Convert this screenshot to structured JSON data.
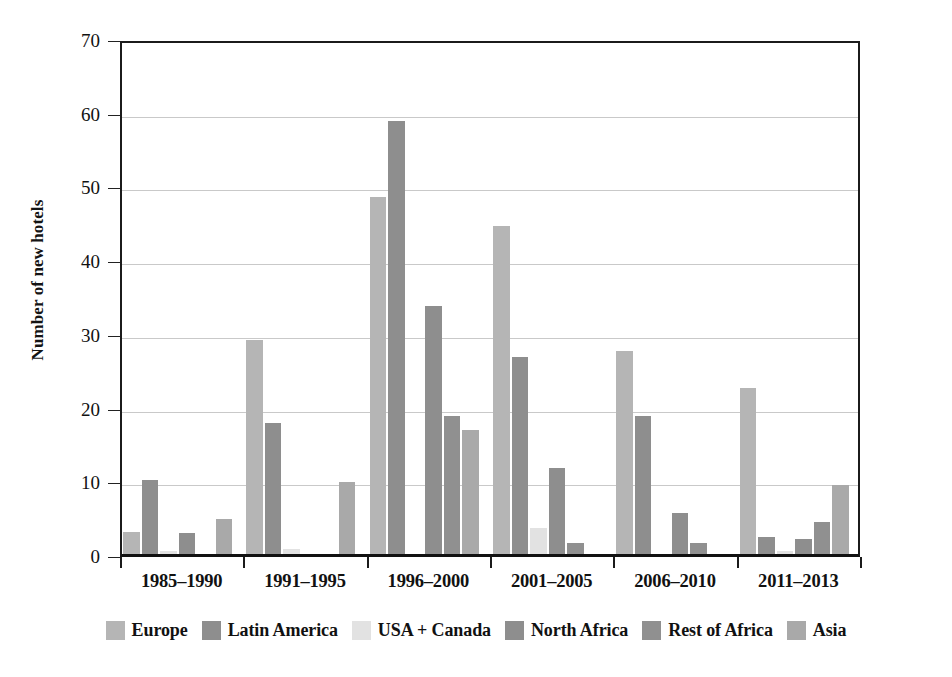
{
  "chart_data": {
    "type": "bar",
    "title": "",
    "subtitle": "",
    "xlabel": "",
    "ylabel": "Number of new hotels",
    "ylim": [
      0,
      70
    ],
    "ytick_labels": [
      "0",
      "10",
      "20",
      "30",
      "40",
      "50",
      "60",
      "70"
    ],
    "ytick_values": [
      0,
      10,
      20,
      30,
      40,
      50,
      60,
      70
    ],
    "grid": true,
    "grid_axis": "y",
    "legend_position": "bottom",
    "categories": [
      "1985–1990",
      "1991–1995",
      "1996–2000",
      "2001–2005",
      "2006–2010",
      "2011–2013"
    ],
    "series": [
      {
        "name": "Europe",
        "color": "#b5b5b5",
        "values": [
          3.0,
          29.0,
          48.5,
          44.5,
          27.5,
          22.5
        ]
      },
      {
        "name": "Latin America",
        "color": "#8e8e8e",
        "values": [
          10.0,
          17.8,
          58.8,
          26.7,
          18.7,
          2.3
        ]
      },
      {
        "name": "USA + Canada",
        "color": "#e2e2e2",
        "values": [
          0.4,
          0.7,
          0.0,
          3.5,
          0.0,
          0.4
        ]
      },
      {
        "name": "North Africa",
        "color": "#8e8e8e",
        "values": [
          2.9,
          0.0,
          33.6,
          11.7,
          5.5,
          2.0
        ]
      },
      {
        "name": "Rest of Africa",
        "color": "#909090",
        "values": [
          0.0,
          0.0,
          18.7,
          1.5,
          1.5,
          4.3
        ]
      },
      {
        "name": "Asia",
        "color": "#a9a9a9",
        "values": [
          4.8,
          9.8,
          16.8,
          0.0,
          0.0,
          9.3
        ]
      }
    ]
  },
  "legend": {
    "items": [
      {
        "label": "Europe",
        "color": "#b5b5b5"
      },
      {
        "label": "Latin America",
        "color": "#8e8e8e"
      },
      {
        "label": "USA + Canada",
        "color": "#e2e2e2"
      },
      {
        "label": "North Africa",
        "color": "#8e8e8e"
      },
      {
        "label": "Rest of Africa",
        "color": "#909090"
      },
      {
        "label": "Asia",
        "color": "#a9a9a9"
      }
    ]
  }
}
